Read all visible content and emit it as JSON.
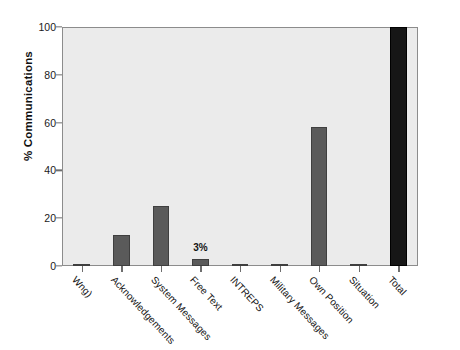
{
  "chart_data": {
    "type": "bar",
    "title": "",
    "subtitle": "",
    "xlabel": "",
    "ylabel": "% Communications",
    "ylim": [
      0,
      100
    ],
    "yticks": [
      0,
      20,
      40,
      60,
      80,
      100
    ],
    "ytick_labels": [
      "0",
      "20",
      "40",
      "60",
      "80",
      "100"
    ],
    "grid": false,
    "legend": null,
    "categories": [
      "Wng)",
      "Acknowledgements",
      "System Messages",
      "Free Text",
      "INTREPS",
      "Military Messages",
      "Own Position",
      "Situation",
      "Total"
    ],
    "values": [
      1,
      13,
      25,
      3,
      0.5,
      0.5,
      58,
      0.7,
      100
    ],
    "bar_colors": [
      "#5a5a5a",
      "#5a5a5a",
      "#5a5a5a",
      "#5a5a5a",
      "#5a5a5a",
      "#5a5a5a",
      "#5a5a5a",
      "#5a5a5a",
      "#161616"
    ],
    "annotations": [
      {
        "category": "Free Text",
        "text": "3%"
      }
    ],
    "plot_background": "#ebebeb",
    "axis_color": "#8c8c8c"
  }
}
